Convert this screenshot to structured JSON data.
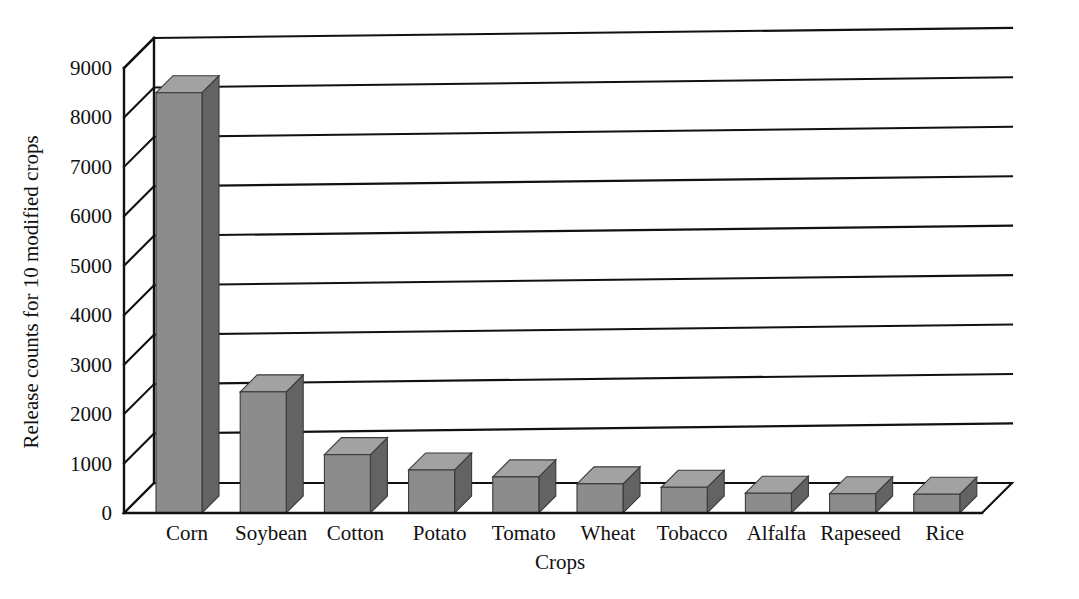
{
  "chart_data": {
    "type": "bar",
    "title": "",
    "subtitle": "",
    "xlabel": "Crops",
    "ylabel": "Release counts for 10 modified crops",
    "categories": [
      "Corn",
      "Soybean",
      "Cotton",
      "Potato",
      "Tomato",
      "Wheat",
      "Tobacco",
      "Alfalfa",
      "Rapeseed",
      "Rice"
    ],
    "values": [
      8500,
      2450,
      1180,
      870,
      730,
      590,
      520,
      400,
      390,
      380
    ],
    "series": [
      {
        "name": "Release counts",
        "values": [
          8500,
          2450,
          1180,
          870,
          730,
          590,
          520,
          400,
          390,
          380
        ]
      }
    ],
    "ylim": [
      0,
      9000
    ],
    "ytick_values": [
      0,
      1000,
      2000,
      3000,
      4000,
      5000,
      6000,
      7000,
      8000,
      9000
    ],
    "ytick_labels": [
      "0",
      "1000",
      "2000",
      "3000",
      "4000",
      "5000",
      "6000",
      "7000",
      "8000",
      "9000"
    ],
    "grid": true,
    "grid_axis": "y",
    "legend": false,
    "legend_position": "none",
    "style": "3d-bar",
    "colors": {
      "bar_front": "#8c8c8c",
      "bar_side": "#636363",
      "bar_top": "#a2a2a2",
      "grid": "#111111",
      "axis": "#111111",
      "background": "#ffffff",
      "text": "#111111"
    }
  },
  "axes": {
    "y_title": "Release counts for 10 modified crops",
    "x_title": "Crops"
  }
}
